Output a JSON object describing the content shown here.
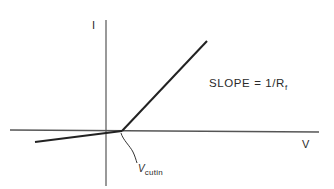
{
  "diagram": {
    "axes": {
      "y_label": "I",
      "x_label": "V"
    },
    "annotations": {
      "slope_prefix": "SLOPE = 1/R",
      "slope_sub": "f",
      "cutin_main": "V",
      "cutin_sub": "cutin"
    },
    "colors": {
      "axis": "#555555",
      "curve": "#222222",
      "background": "#ffffff"
    },
    "geometry": {
      "origin": [
        106,
        130
      ],
      "cutin_point": [
        122,
        130
      ],
      "forward_end": [
        207,
        41
      ],
      "reverse_end": [
        35,
        142
      ]
    }
  }
}
